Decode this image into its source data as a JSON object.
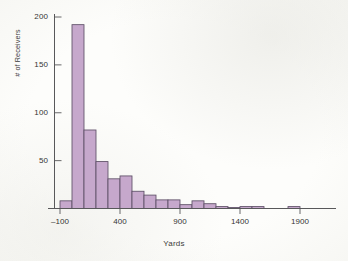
{
  "chart_data": {
    "type": "bar",
    "title": "",
    "subtitle": "",
    "xlabel": "Yards",
    "ylabel": "# of Receivers",
    "grid": false,
    "legend": null,
    "xlim": [
      -150,
      2000
    ],
    "ylim": [
      0,
      205
    ],
    "bin_width": 100,
    "x_ticks": [
      -100,
      400,
      900,
      1400,
      1900
    ],
    "x_tick_labels": [
      "–100",
      "400",
      "900",
      "1400",
      "1900"
    ],
    "y_ticks": [
      50,
      100,
      150,
      200
    ],
    "y_tick_labels": [
      "50",
      "100",
      "150",
      "200"
    ],
    "bin_starts": [
      -100,
      0,
      100,
      200,
      300,
      400,
      500,
      600,
      700,
      800,
      900,
      1000,
      1100,
      1200,
      1300,
      1400,
      1500,
      1800
    ],
    "bin_labels": [
      "-100 to 0",
      "0 to 100",
      "100 to 200",
      "200 to 300",
      "300 to 400",
      "400 to 500",
      "500 to 600",
      "600 to 700",
      "700 to 800",
      "800 to 900",
      "900 to 1000",
      "1000 to 1100",
      "1100 to 1200",
      "1200 to 1300",
      "1300 to 1400",
      "1400 to 1500",
      "1500 to 1600",
      "1800 to 1900"
    ],
    "values": [
      8,
      192,
      82,
      49,
      31,
      34,
      18,
      14,
      9,
      9,
      4,
      8,
      5,
      2,
      1,
      2,
      2,
      2
    ],
    "bar_fill_color": "#c6a8cc",
    "bar_edge_color": "#5d4f66",
    "axis_color": "#58585a",
    "text_color": "#343434",
    "background_color": "#fdfdfb"
  },
  "axes": {
    "ylabel_text": "# of Receivers",
    "xlabel_text": "Yards"
  }
}
